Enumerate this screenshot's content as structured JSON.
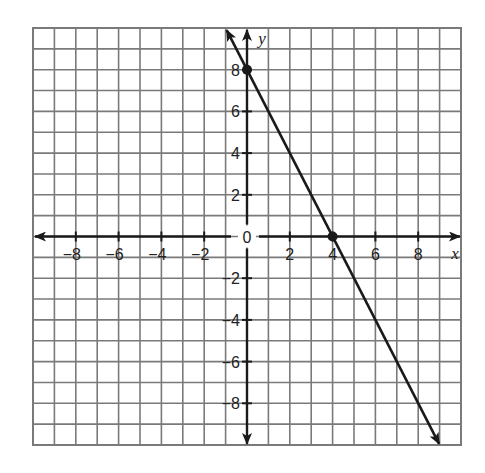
{
  "chart_data": {
    "type": "line",
    "title": "",
    "xlabel": "x",
    "ylabel": "y",
    "xlim": [
      -10,
      10
    ],
    "ylim": [
      -10,
      10
    ],
    "grid": true,
    "grid_step": 1,
    "x_ticks": [
      -8,
      -6,
      -4,
      -2,
      2,
      4,
      6,
      8
    ],
    "y_ticks": [
      8,
      6,
      4,
      2,
      -2,
      -4,
      -6,
      -8
    ],
    "x_tick_labels": [
      "−8",
      "−6",
      "−4",
      "−2",
      "2",
      "4",
      "6",
      "8"
    ],
    "y_tick_labels": [
      "8",
      "6",
      "4",
      "2",
      "−2",
      "−4",
      "−6",
      "−8"
    ],
    "origin_label": "0",
    "series": [
      {
        "name": "line",
        "equation": "y = -2x + 8",
        "slope": -2,
        "y_intercept": 8,
        "x_intercept": 4,
        "arrows_both_ends": true,
        "marked_points": [
          {
            "x": 0,
            "y": 8
          },
          {
            "x": 4,
            "y": 0
          }
        ]
      }
    ],
    "legend": null
  },
  "colors": {
    "grid": "#7a7a7a",
    "axis": "#1a1a1a",
    "line": "#1a1a1a",
    "background": "#ffffff"
  }
}
